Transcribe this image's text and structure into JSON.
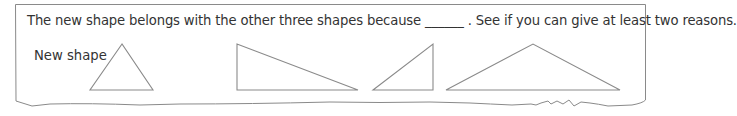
{
  "prompt": {
    "text": "The new shape belongs with the other three shapes because ______ . See if you can give at least two reasons."
  },
  "new_shape_label": "New shape",
  "colors": {
    "stroke": "#8a8a8a",
    "text": "#333333",
    "background": "#ffffff"
  },
  "shapes": [
    {
      "name": "new-shape-isosceles-triangle",
      "type": "triangle",
      "points": "122,44 90,90 153,90"
    },
    {
      "name": "right-triangle-wide",
      "type": "triangle",
      "points": "237,44 237,90 358,90"
    },
    {
      "name": "right-triangle-small",
      "type": "triangle",
      "points": "373,90 433,44 433,90"
    },
    {
      "name": "obtuse-triangle",
      "type": "triangle",
      "points": "446,90 533,44 620,90"
    }
  ]
}
